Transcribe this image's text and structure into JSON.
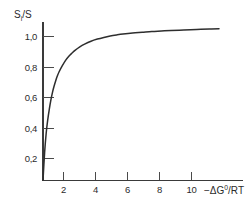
{
  "chart_data": {
    "type": "line",
    "title": "",
    "subtitle": "",
    "ylabel": "S i /S",
    "ylabel_parts": {
      "base": "S",
      "sub": "i",
      "tail": "/S"
    },
    "xlabel": "−ΔG⁰/RT",
    "xlabel_parts": {
      "minus": "−",
      "delta": "Δ",
      "g": "G",
      "sup": "0",
      "tail": "/RT"
    },
    "xlim": [
      0,
      11.6
    ],
    "ylim": [
      0,
      1.12
    ],
    "xticks": [
      2,
      4,
      6,
      8,
      10
    ],
    "xtick_labels": [
      "2",
      "4",
      "6",
      "8",
      "10"
    ],
    "yticks": [
      0.2,
      0.4,
      0.6,
      0.8,
      1.0
    ],
    "ytick_labels": [
      "0,2",
      "0,4",
      "0,6",
      "0,8",
      "1,0"
    ],
    "grid": false,
    "legend": null,
    "legend_position": "none",
    "curve_color": "#2e2e2e",
    "axis_color": "#3a3a3a",
    "series": [
      {
        "name": "saturation",
        "x": [
          0.0,
          0.1,
          0.2,
          0.3,
          0.4,
          0.5,
          0.6,
          0.7,
          0.8,
          0.9,
          1.0,
          1.2,
          1.4,
          1.6,
          1.8,
          2.0,
          2.3,
          2.6,
          3.0,
          3.4,
          3.8,
          4.2,
          4.6,
          5.0,
          5.6,
          6.2,
          6.8,
          7.4,
          8.0,
          8.8,
          9.6,
          10.4,
          11.0
        ],
        "y": [
          0.0,
          0.18,
          0.31,
          0.4,
          0.47,
          0.53,
          0.58,
          0.62,
          0.655,
          0.685,
          0.71,
          0.75,
          0.785,
          0.812,
          0.833,
          0.852,
          0.875,
          0.893,
          0.912,
          0.926,
          0.937,
          0.946,
          0.953,
          0.959,
          0.966,
          0.971,
          0.976,
          0.979,
          0.982,
          0.986,
          0.989,
          0.992,
          0.994
        ]
      }
    ]
  },
  "axes": {
    "y_axis_name": "y-axis",
    "x_axis_name": "x-axis"
  }
}
